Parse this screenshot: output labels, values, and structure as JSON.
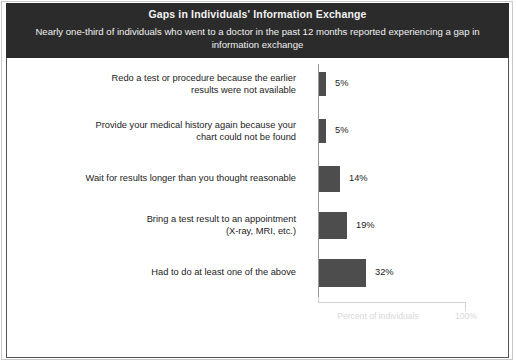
{
  "header": {
    "title": "Gaps in Individuals' Information Exchange",
    "subtitle": "Nearly one-third of individuals who went to a doctor in the past 12 months reported experiencing a gap in information exchange"
  },
  "colors": {
    "header_background": "#2b2b2b",
    "header_text": "#f2f2f2",
    "bar_fill": "#4d4d4d",
    "panel_background": "#ffffff",
    "panel_border": "#555555",
    "axis_line": "#9a9a9a",
    "axis_label_text": "#d8d8d8"
  },
  "chart_data": {
    "type": "bar",
    "orientation": "horizontal",
    "title": "Gaps in Individuals' Information Exchange",
    "subtitle": "Nearly one-third of individuals who went to a doctor in the past 12 months reported experiencing a gap in information exchange",
    "xlabel": "Percent of individuals",
    "ylabel": "",
    "xlim": [
      0,
      100
    ],
    "xtick_labels": [
      "100%"
    ],
    "grid": false,
    "legend": null,
    "categories": [
      "Redo a test or procedure because the earlier results were not available",
      "Provide your medical history again because your chart could not be found",
      "Wait for results longer than you thought reasonable",
      "Bring a test result to an appointment (X-ray, MRI, etc.)",
      "Had to do at least one of the above"
    ],
    "values": [
      5,
      5,
      14,
      19,
      32
    ],
    "value_labels": [
      "5%",
      "5%",
      "14%",
      "19%",
      "32%"
    ]
  },
  "rows": [
    {
      "label_line1": "Redo a test or procedure because the earlier",
      "label_line2": "results were not available",
      "value": 5,
      "value_label": "5%"
    },
    {
      "label_line1": "Provide your medical history again because your",
      "label_line2": "chart could not be found",
      "value": 5,
      "value_label": "5%"
    },
    {
      "label_line1": "Wait for results longer than you thought reasonable",
      "label_line2": "",
      "value": 14,
      "value_label": "14%"
    },
    {
      "label_line1": "Bring a test result to an appointment",
      "label_line2": "(X-ray, MRI, etc.)",
      "value": 19,
      "value_label": "19%"
    },
    {
      "label_line1": "Had to do at least one of the above",
      "label_line2": "",
      "value": 32,
      "value_label": "32%"
    }
  ],
  "axis": {
    "label": "Percent of individuals",
    "max_label": "100%"
  }
}
